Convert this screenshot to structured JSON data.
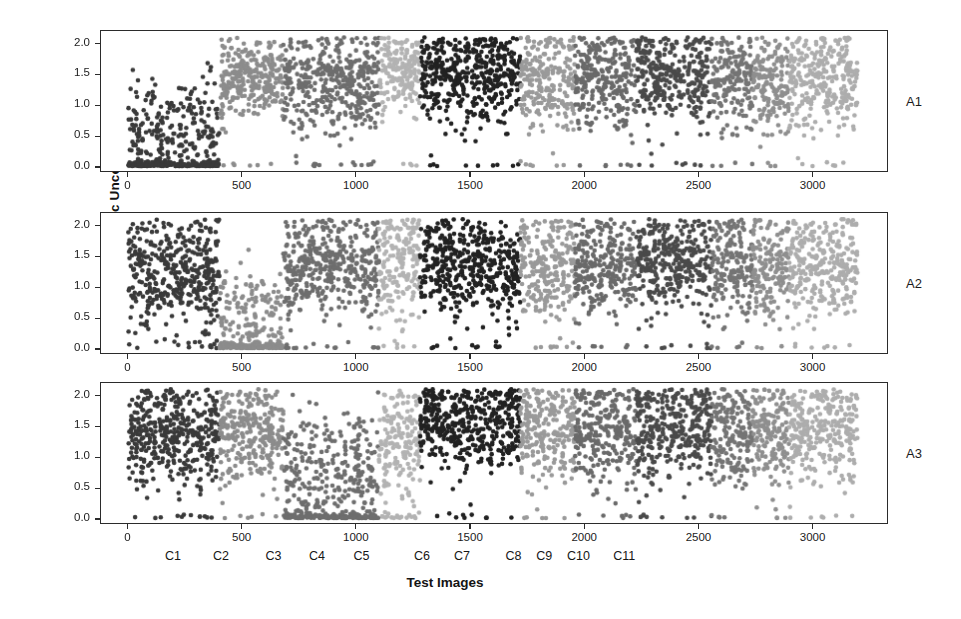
{
  "chart_data": {
    "type": "scatter",
    "title": "",
    "xlabel": "Test Images",
    "ylabel": "Epistemic Uncertainty",
    "xlim": [
      -120,
      3330
    ],
    "ylim": [
      -0.08,
      2.22
    ],
    "grid": false,
    "legend": null,
    "xticks": [
      0,
      500,
      1000,
      1500,
      2000,
      2500,
      3000
    ],
    "xticklabels": [
      "0",
      "500",
      "1000",
      "1500",
      "2000",
      "2500",
      "3000"
    ],
    "yticks": [
      0.0,
      0.5,
      1.0,
      1.5,
      2.0
    ],
    "yticklabels": [
      "0.0",
      "0.5",
      "1.0",
      "1.5",
      "2.0"
    ],
    "class_labels": [
      "C1",
      "C2",
      "C3",
      "C4",
      "C5",
      "C6",
      "C7",
      "C8",
      "C9",
      "C10",
      "C11"
    ],
    "class_label_centers": [
      200,
      410,
      640,
      830,
      1025,
      1290,
      1465,
      1690,
      1825,
      1975,
      2175
    ],
    "class_boundaries": [
      {
        "name": "C1",
        "start": 0,
        "end": 400,
        "gray": "#3a3a3a"
      },
      {
        "name": "C2",
        "start": 400,
        "end": 680,
        "gray": "#8c8c8c"
      },
      {
        "name": "C3",
        "start": 680,
        "end": 1100,
        "gray": "#6e6e6e"
      },
      {
        "name": "C4",
        "start": 1100,
        "end": 1280,
        "gray": "#b3b3b3"
      },
      {
        "name": "C5",
        "start": 1280,
        "end": 1720,
        "gray": "#222222"
      },
      {
        "name": "C6",
        "start": 1720,
        "end": 1960,
        "gray": "#9a9a9a"
      },
      {
        "name": "C7",
        "start": 1960,
        "end": 2230,
        "gray": "#6a6a6a"
      },
      {
        "name": "C8",
        "start": 2230,
        "end": 2560,
        "gray": "#4a4a4a"
      },
      {
        "name": "C9",
        "start": 2560,
        "end": 2740,
        "gray": "#757575"
      },
      {
        "name": "C10",
        "start": 2740,
        "end": 2900,
        "gray": "#8f8f8f"
      },
      {
        "name": "C11",
        "start": 2900,
        "end": 3200,
        "gray": "#adadad"
      }
    ],
    "panels": [
      {
        "tag": "A1",
        "n_points": 3200,
        "clusters": [
          {
            "class": "C1",
            "x0": 0,
            "x1": 400,
            "n": 430,
            "mean": 0.52,
            "spread": 0.46,
            "zero_band": 0.4,
            "gray": "#3a3a3a",
            "dot": 2.3
          },
          {
            "class": "C2",
            "x0": 400,
            "x1": 680,
            "n": 300,
            "mean": 1.46,
            "spread": 0.34,
            "zero_band": 0.02,
            "gray": "#8c8c8c",
            "dot": 2.3
          },
          {
            "class": "C3",
            "x0": 680,
            "x1": 1100,
            "n": 440,
            "mean": 1.38,
            "spread": 0.42,
            "zero_band": 0.03,
            "gray": "#6e6e6e",
            "dot": 2.3
          },
          {
            "class": "C4",
            "x0": 1100,
            "x1": 1280,
            "n": 190,
            "mean": 1.6,
            "spread": 0.33,
            "zero_band": 0.02,
            "gray": "#b3b3b3",
            "dot": 2.3
          },
          {
            "class": "C5",
            "x0": 1280,
            "x1": 1720,
            "n": 470,
            "mean": 1.52,
            "spread": 0.4,
            "zero_band": 0.02,
            "gray": "#222222",
            "dot": 2.3
          },
          {
            "class": "C6",
            "x0": 1720,
            "x1": 1960,
            "n": 250,
            "mean": 1.38,
            "spread": 0.45,
            "zero_band": 0.02,
            "gray": "#9a9a9a",
            "dot": 2.3
          },
          {
            "class": "C7",
            "x0": 1960,
            "x1": 2230,
            "n": 280,
            "mean": 1.42,
            "spread": 0.44,
            "zero_band": 0.02,
            "gray": "#6a6a6a",
            "dot": 2.3
          },
          {
            "class": "C8",
            "x0": 2230,
            "x1": 2560,
            "n": 340,
            "mean": 1.5,
            "spread": 0.4,
            "zero_band": 0.02,
            "gray": "#4a4a4a",
            "dot": 2.3
          },
          {
            "class": "C9",
            "x0": 2560,
            "x1": 2740,
            "n": 190,
            "mean": 1.45,
            "spread": 0.42,
            "zero_band": 0.02,
            "gray": "#757575",
            "dot": 2.3
          },
          {
            "class": "C10",
            "x0": 2740,
            "x1": 2900,
            "n": 170,
            "mean": 1.4,
            "spread": 0.44,
            "zero_band": 0.02,
            "gray": "#8f8f8f",
            "dot": 2.3
          },
          {
            "class": "C11",
            "x0": 2900,
            "x1": 3200,
            "n": 300,
            "mean": 1.44,
            "spread": 0.44,
            "zero_band": 0.02,
            "gray": "#adadad",
            "dot": 2.3
          }
        ]
      },
      {
        "tag": "A2",
        "n_points": 3200,
        "clusters": [
          {
            "class": "C1",
            "x0": 0,
            "x1": 400,
            "n": 430,
            "mean": 1.22,
            "spread": 0.48,
            "zero_band": 0.02,
            "gray": "#3a3a3a",
            "dot": 2.3
          },
          {
            "class": "C2",
            "x0": 400,
            "x1": 680,
            "n": 300,
            "mean": 0.48,
            "spread": 0.42,
            "zero_band": 0.42,
            "gray": "#8c8c8c",
            "dot": 2.3
          },
          {
            "class": "C3",
            "x0": 680,
            "x1": 1100,
            "n": 440,
            "mean": 1.34,
            "spread": 0.42,
            "zero_band": 0.03,
            "gray": "#6e6e6e",
            "dot": 2.3
          },
          {
            "class": "C4",
            "x0": 1100,
            "x1": 1280,
            "n": 190,
            "mean": 1.4,
            "spread": 0.45,
            "zero_band": 0.02,
            "gray": "#b3b3b3",
            "dot": 2.3
          },
          {
            "class": "C5",
            "x0": 1280,
            "x1": 1720,
            "n": 470,
            "mean": 1.36,
            "spread": 0.42,
            "zero_band": 0.02,
            "gray": "#222222",
            "dot": 2.3
          },
          {
            "class": "C6",
            "x0": 1720,
            "x1": 1960,
            "n": 250,
            "mean": 1.3,
            "spread": 0.46,
            "zero_band": 0.02,
            "gray": "#9a9a9a",
            "dot": 2.3
          },
          {
            "class": "C7",
            "x0": 1960,
            "x1": 2230,
            "n": 280,
            "mean": 1.34,
            "spread": 0.45,
            "zero_band": 0.02,
            "gray": "#6a6a6a",
            "dot": 2.3
          },
          {
            "class": "C8",
            "x0": 2230,
            "x1": 2560,
            "n": 340,
            "mean": 1.42,
            "spread": 0.42,
            "zero_band": 0.02,
            "gray": "#4a4a4a",
            "dot": 2.3
          },
          {
            "class": "C9",
            "x0": 2560,
            "x1": 2740,
            "n": 190,
            "mean": 1.34,
            "spread": 0.44,
            "zero_band": 0.02,
            "gray": "#757575",
            "dot": 2.3
          },
          {
            "class": "C10",
            "x0": 2740,
            "x1": 2900,
            "n": 170,
            "mean": 1.32,
            "spread": 0.46,
            "zero_band": 0.02,
            "gray": "#8f8f8f",
            "dot": 2.3
          },
          {
            "class": "C11",
            "x0": 2900,
            "x1": 3200,
            "n": 300,
            "mean": 1.34,
            "spread": 0.46,
            "zero_band": 0.02,
            "gray": "#adadad",
            "dot": 2.3
          }
        ]
      },
      {
        "tag": "A3",
        "n_points": 3200,
        "clusters": [
          {
            "class": "C1",
            "x0": 0,
            "x1": 400,
            "n": 430,
            "mean": 1.4,
            "spread": 0.46,
            "zero_band": 0.02,
            "gray": "#3a3a3a",
            "dot": 2.3
          },
          {
            "class": "C2",
            "x0": 400,
            "x1": 680,
            "n": 300,
            "mean": 1.42,
            "spread": 0.4,
            "zero_band": 0.02,
            "gray": "#8c8c8c",
            "dot": 2.3
          },
          {
            "class": "C3",
            "x0": 680,
            "x1": 1100,
            "n": 440,
            "mean": 0.72,
            "spread": 0.52,
            "zero_band": 0.3,
            "gray": "#6e6e6e",
            "dot": 2.3
          },
          {
            "class": "C4",
            "x0": 1100,
            "x1": 1280,
            "n": 190,
            "mean": 1.2,
            "spread": 0.5,
            "zero_band": 0.08,
            "gray": "#b3b3b3",
            "dot": 2.3
          },
          {
            "class": "C5",
            "x0": 1280,
            "x1": 1720,
            "n": 470,
            "mean": 1.58,
            "spread": 0.38,
            "zero_band": 0.02,
            "gray": "#222222",
            "dot": 2.3
          },
          {
            "class": "C6",
            "x0": 1720,
            "x1": 1960,
            "n": 250,
            "mean": 1.44,
            "spread": 0.44,
            "zero_band": 0.02,
            "gray": "#9a9a9a",
            "dot": 2.3
          },
          {
            "class": "C7",
            "x0": 1960,
            "x1": 2230,
            "n": 280,
            "mean": 1.4,
            "spread": 0.46,
            "zero_band": 0.02,
            "gray": "#6a6a6a",
            "dot": 2.3
          },
          {
            "class": "C8",
            "x0": 2230,
            "x1": 2560,
            "n": 340,
            "mean": 1.5,
            "spread": 0.42,
            "zero_band": 0.02,
            "gray": "#4a4a4a",
            "dot": 2.3
          },
          {
            "class": "C9",
            "x0": 2560,
            "x1": 2740,
            "n": 190,
            "mean": 1.42,
            "spread": 0.44,
            "zero_band": 0.02,
            "gray": "#757575",
            "dot": 2.3
          },
          {
            "class": "C10",
            "x0": 2740,
            "x1": 2900,
            "n": 170,
            "mean": 1.4,
            "spread": 0.44,
            "zero_band": 0.02,
            "gray": "#8f8f8f",
            "dot": 2.3
          },
          {
            "class": "C11",
            "x0": 2900,
            "x1": 3200,
            "n": 300,
            "mean": 1.46,
            "spread": 0.44,
            "zero_band": 0.02,
            "gray": "#adadad",
            "dot": 2.3
          }
        ]
      }
    ]
  }
}
